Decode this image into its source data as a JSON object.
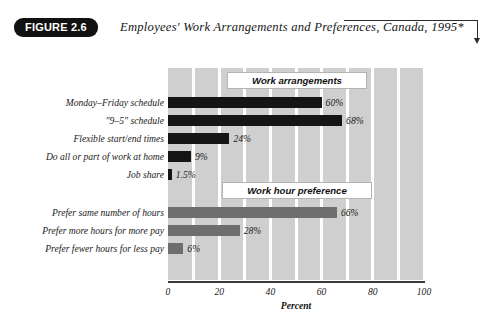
{
  "figure": {
    "tag": "FIGURE 2.6",
    "title": "Employees' Work Arrangements and Preferences, Canada, 1995*"
  },
  "chart_data": {
    "type": "bar",
    "orientation": "horizontal",
    "title": "Employees' Work Arrangements and Preferences, Canada, 1995*",
    "xlabel": "Percent",
    "ylabel": "",
    "xlim": [
      0,
      100
    ],
    "xticks": [
      "0",
      "20",
      "40",
      "60",
      "80",
      "100"
    ],
    "xtick_values": [
      0,
      20,
      40,
      60,
      80,
      100
    ],
    "grid": "vertical-white-every-10",
    "legend": "none",
    "groups": [
      {
        "name": "Work arrangements",
        "color": "#151515",
        "categories": [
          "Monday–Friday schedule",
          "\"9–5\" schedule",
          "Flexible start/end times",
          "Do all or part of work at home",
          "Job share"
        ],
        "values": [
          60,
          68,
          24,
          9,
          1.5
        ],
        "labels": [
          "60%",
          "68%",
          "24%",
          "9%",
          "1.5%"
        ]
      },
      {
        "name": "Work hour preference",
        "color": "#6e6e6e",
        "categories": [
          "Prefer same number of hours",
          "Prefer more hours for more pay",
          "Prefer fewer hours for less pay"
        ],
        "values": [
          66,
          28,
          6
        ],
        "labels": [
          "66%",
          "28%",
          "6%"
        ]
      }
    ]
  },
  "colors": {
    "plot_background": "#cfcfcf",
    "gridline": "#ffffff",
    "group1_bar": "#151515",
    "group2_bar": "#6e6e6e",
    "tag_background": "#111111",
    "axis": "#3a3a3a"
  }
}
